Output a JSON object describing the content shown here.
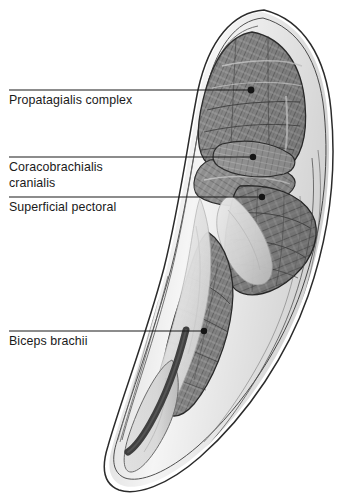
{
  "figure": {
    "medium": "graphite-pencil-illustration",
    "background_color": "#ffffff",
    "ink_color": "#1a1a1a",
    "muscle_base_color": "#8a8a8a",
    "muscle_dark_color": "#4a4a4a",
    "muscle_light_color": "#c9c9c9",
    "tendon_color": "#3c3c3c",
    "fascia_color": "#ededed"
  },
  "annotations": {
    "leader_color": "#1b1b1b",
    "dot_color": "#141414",
    "items": [
      {
        "id": "propatagialis-complex",
        "label": "Propatagialis complex",
        "line_y": 90,
        "line_x_start": 9,
        "line_x_end": 251,
        "dot_x": 251,
        "dot_y": 90,
        "dot_r": 3.4
      },
      {
        "id": "coracobrachialis-cranialis",
        "label": "Coracobrachialis\ncranialis",
        "line_y": 157,
        "line_x_start": 9,
        "line_x_end": 253,
        "dot_x": 253,
        "dot_y": 157,
        "dot_r": 3.2
      },
      {
        "id": "superficial-pectoral",
        "label": "Superficial pectoral",
        "line_y": 197,
        "line_x_start": 9,
        "line_x_end": 262,
        "dot_x": 262,
        "dot_y": 197,
        "dot_r": 3.2
      },
      {
        "id": "biceps-brachii",
        "label": "Biceps brachii",
        "line_y": 331,
        "line_x_start": 9,
        "line_x_end": 204,
        "dot_x": 204,
        "dot_y": 331,
        "dot_r": 3.2
      }
    ]
  }
}
